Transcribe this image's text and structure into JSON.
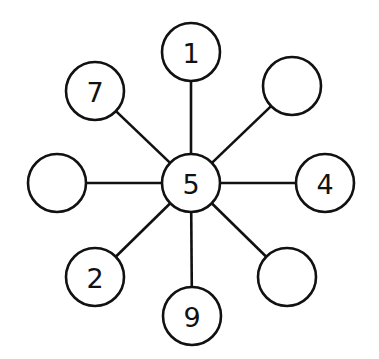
{
  "diagram": {
    "type": "star-graph",
    "center": {
      "id": "center",
      "label": "5",
      "x": 191,
      "y": 183
    },
    "radius": 29,
    "nodes": [
      {
        "id": "top",
        "label": "1",
        "x": 191,
        "y": 52
      },
      {
        "id": "top-left",
        "label": "7",
        "x": 95,
        "y": 91
      },
      {
        "id": "top-right",
        "label": "",
        "x": 292,
        "y": 86
      },
      {
        "id": "left",
        "label": "",
        "x": 57,
        "y": 183
      },
      {
        "id": "right",
        "label": "4",
        "x": 325,
        "y": 183
      },
      {
        "id": "bottom-left",
        "label": "2",
        "x": 95,
        "y": 277
      },
      {
        "id": "bottom",
        "label": "9",
        "x": 192,
        "y": 316
      },
      {
        "id": "bottom-right",
        "label": "",
        "x": 287,
        "y": 277
      }
    ],
    "colors": {
      "stroke": "#111111",
      "fill": "#ffffff",
      "background": "#ffffff"
    }
  }
}
